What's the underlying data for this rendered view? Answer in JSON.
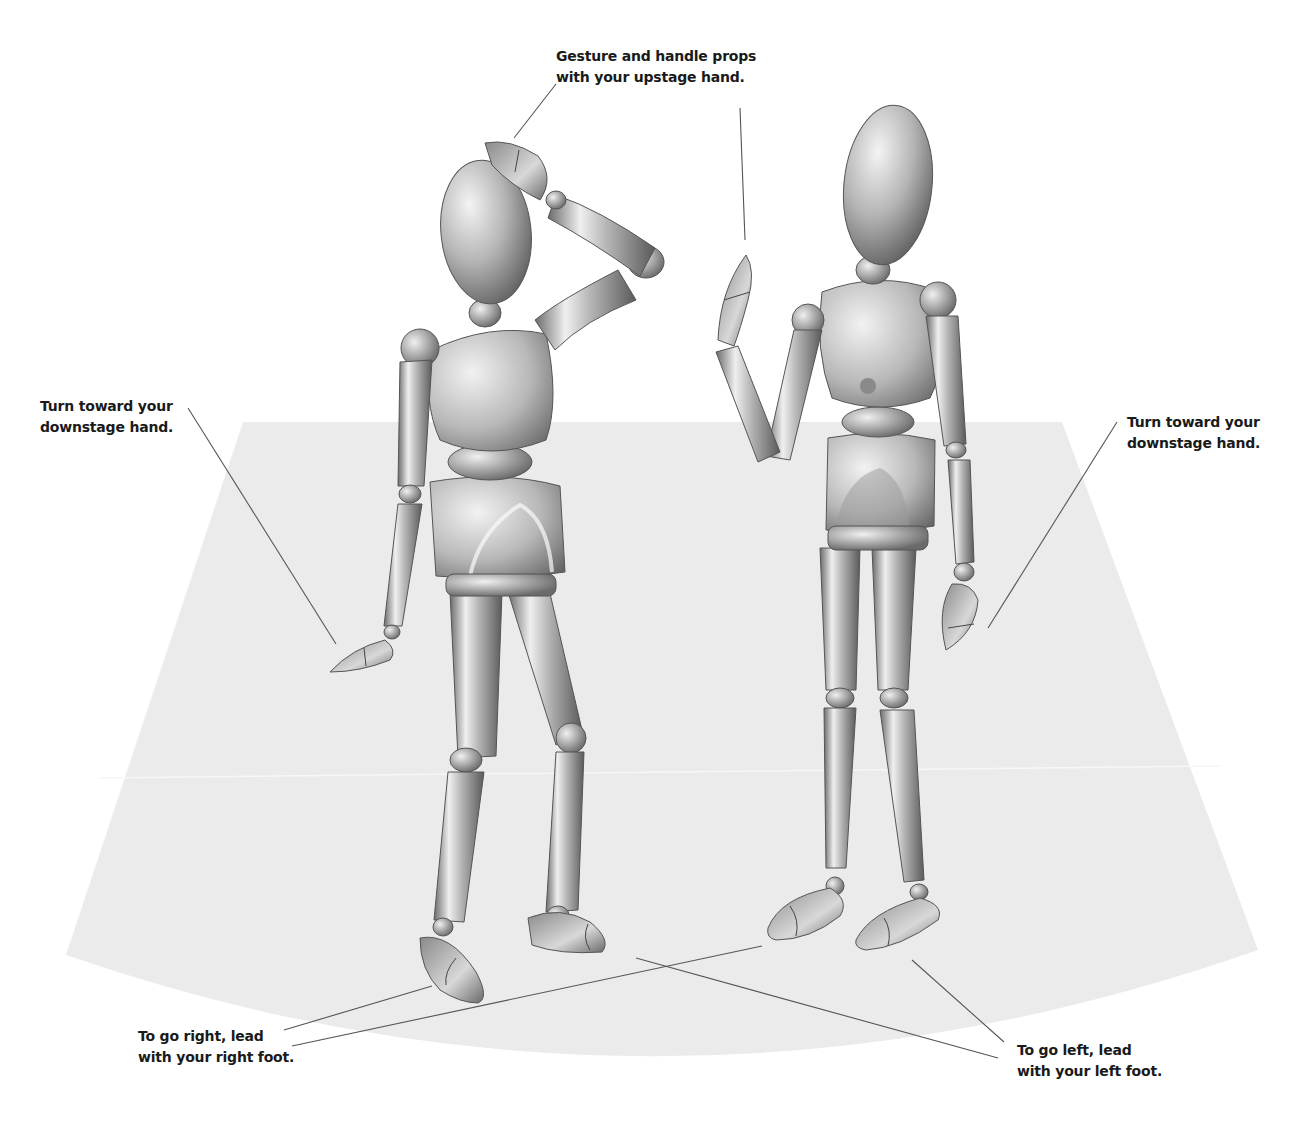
{
  "diagram": {
    "colors": {
      "background": "#ffffff",
      "stage_floor": "#ebebeb",
      "leader_line": "#555555",
      "label_text": "#1a1a1a",
      "figure_light": "#e2e2e2",
      "figure_mid": "#a8a8a8",
      "figure_dark": "#5e5e5e"
    },
    "figures": [
      {
        "name": "left-mannequin",
        "pose": "right hand raised to head, left arm hanging down, stepping forward"
      },
      {
        "name": "right-mannequin",
        "pose": "left hand raised in gesture, right arm hanging down, standing"
      }
    ]
  },
  "labels": {
    "gesture": {
      "line1": "Gesture and handle props",
      "line2": "with your upstage hand."
    },
    "turn_left": {
      "line1": "Turn toward your",
      "line2": "downstage hand."
    },
    "turn_right": {
      "line1": "Turn toward your",
      "line2": "downstage hand."
    },
    "go_right": {
      "line1": "To go right,  lead",
      "line2": "with your right foot."
    },
    "go_left": {
      "line1": "To go left, lead",
      "line2": "with your left foot."
    }
  }
}
